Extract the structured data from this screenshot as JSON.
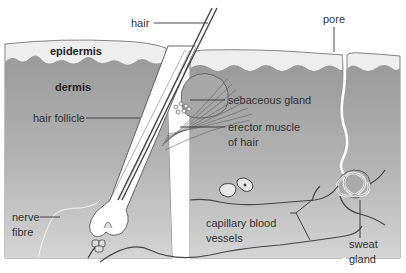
{
  "colors": {
    "epidermis": "#eeeeee",
    "dermis_top": "#9a9a9a",
    "dermis_bottom": "#cfcfcf",
    "outline": "#555555",
    "vessel": "#444444",
    "background": "#ffffff"
  },
  "labels": {
    "hair": "hair",
    "pore": "pore",
    "epidermis": "epidermis",
    "dermis": "dermis",
    "hair_follicle": "hair follicle",
    "sebaceous_gland": "sebaceous gland",
    "erector_muscle_line1": "erector muscle",
    "erector_muscle_line2": "of hair",
    "nerve_fibre_line1": "nerve",
    "nerve_fibre_line2": "fibre",
    "capillary_line1": "capillary blood",
    "capillary_line2": "vessels",
    "sweat_gland_line1": "sweat",
    "sweat_gland_line2": "gland"
  }
}
